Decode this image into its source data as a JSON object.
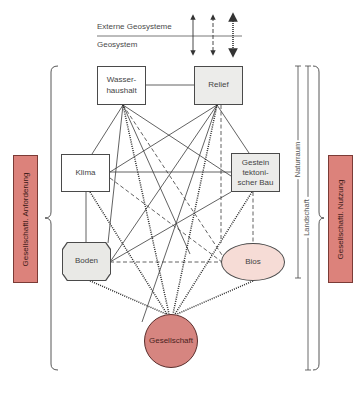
{
  "legend": {
    "external_label": "Externe Geosysteme",
    "internal_label": "Geosystem",
    "arrow_styles": [
      "solid",
      "dashed",
      "dotted"
    ]
  },
  "nodes": {
    "wasserhaushalt": "Wasser-\nhaushalt",
    "relief": "Relief",
    "klima": "Klima",
    "gestein": "Gestein\ntektoni-\nscher Bau",
    "boden": "Boden",
    "bios": "Bios",
    "gesellschaft": "Gesellschaft"
  },
  "side_bars": {
    "left": "Gesellschaftl. Anforderung",
    "right": "Gesellschaftl. Nutzung"
  },
  "range_labels": {
    "naturraum": "Naturraum",
    "landschaft": "Landschaft"
  },
  "colors": {
    "red_bar": "#dc827b",
    "gesellschaft_fill": "#d68580",
    "bios_fill": "#f6dcd6",
    "grey_box": "#ececea",
    "line": "#3a3a3a"
  }
}
